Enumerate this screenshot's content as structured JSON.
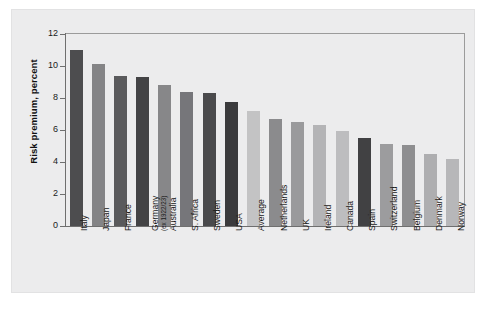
{
  "chart_data": {
    "type": "bar",
    "title": "",
    "xlabel": "",
    "ylabel": "Risk premium, percent",
    "ylim": [
      0,
      12
    ],
    "ytick_values": [
      0,
      2,
      4,
      6,
      8,
      10,
      12
    ],
    "ytick_labels": [
      "0",
      "2",
      "4",
      "6",
      "8",
      "10",
      "12"
    ],
    "grid": false,
    "legend": "none",
    "categories": [
      "Italy",
      "Japan",
      "France",
      "Germany",
      "Australia",
      "S. Africa",
      "Sweden",
      "USA",
      "Average",
      "Netherlands",
      "UK",
      "Ireland",
      "Canada",
      "Spain",
      "Switzerland",
      "Belgium",
      "Denmark",
      "Norway"
    ],
    "category_labels": [
      "Italy",
      "Japan",
      "France",
      "Germany",
      "Australia",
      "S. Africa",
      "Sweden",
      "USA",
      "Average",
      "Netherlands",
      "UK",
      "Ireland",
      "Canada",
      "Spain",
      "Switzerland",
      "Belgium",
      "Denmark",
      "Norway"
    ],
    "category_sublabels": [
      "",
      "",
      "",
      "(ex 1922/23)",
      "",
      "",
      "",
      "",
      "",
      "",
      "",
      "",
      "",
      "",
      "",
      "",
      "",
      ""
    ],
    "values": [
      11.0,
      10.1,
      9.4,
      9.3,
      8.8,
      8.35,
      8.3,
      7.75,
      7.2,
      6.7,
      6.5,
      6.3,
      5.95,
      5.5,
      5.1,
      5.05,
      4.5,
      4.2
    ],
    "bar_colors": [
      "#4d4d4f",
      "#848486",
      "#5a5a5c",
      "#434345",
      "#878789",
      "#76767a",
      "#4a4a4c",
      "#3a3a3c",
      "#c3c3c4",
      "#8b8b8d",
      "#9a9a9c",
      "#b4b4b6",
      "#bdbdbf",
      "#414143",
      "#9c9c9e",
      "#8e8e90",
      "#aeaeb0",
      "#b7b7b9"
    ]
  },
  "figure": {
    "background_color": "#ffffff",
    "panel_color": "#ececed",
    "axis_color": "#6f6f6f"
  }
}
